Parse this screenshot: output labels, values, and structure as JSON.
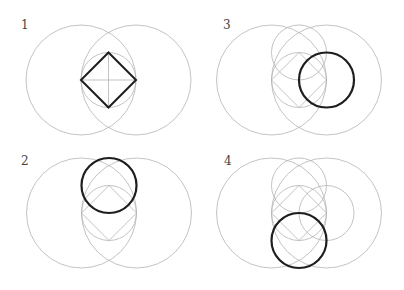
{
  "colors": {
    "guide": "#b4b4b4",
    "bold": "#1e1e1e",
    "label": "#444444",
    "background": "#ffffff"
  },
  "geometry": {
    "big_radius": 55,
    "small_radius": 27.5,
    "big_offset_x": 27.5
  },
  "panels": [
    {
      "label": "1",
      "label_pos": [
        21,
        19
      ],
      "center": [
        108.5,
        80
      ],
      "guide_circles": [
        "center"
      ],
      "highlight": "diamond",
      "crosshair": true,
      "bold_circle": null
    },
    {
      "label": "2",
      "label_pos": [
        21,
        155
      ],
      "center": [
        109,
        213
      ],
      "guide_circles": [
        "center"
      ],
      "highlight": "circle",
      "crosshair": false,
      "bold_circle": "top"
    },
    {
      "label": "3",
      "label_pos": [
        223,
        19
      ],
      "center": [
        299,
        80
      ],
      "guide_circles": [
        "center",
        "top"
      ],
      "highlight": "circle",
      "crosshair": false,
      "bold_circle": "right"
    },
    {
      "label": "4",
      "label_pos": [
        224,
        155
      ],
      "center": [
        299,
        213
      ],
      "guide_circles": [
        "center",
        "top",
        "right"
      ],
      "highlight": "circle",
      "crosshair": false,
      "bold_circle": "bottom"
    }
  ]
}
